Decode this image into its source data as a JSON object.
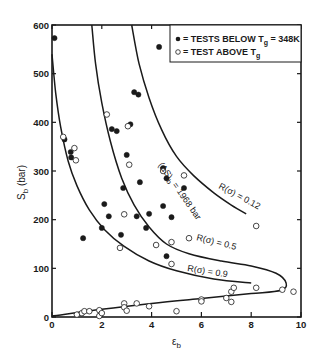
{
  "chart_data": {
    "type": "scatter",
    "title": "",
    "xlabel": "ε_b",
    "ylabel": "S_b (bar)",
    "xlim": [
      0,
      10
    ],
    "ylim": [
      0,
      600
    ],
    "grid": false,
    "x_ticks": [
      0,
      2,
      4,
      6,
      8,
      10
    ],
    "x_tick_labels": [
      "0",
      "2",
      "4",
      "6",
      "8",
      "10"
    ],
    "y_ticks": [
      0,
      100,
      200,
      300,
      400,
      500,
      600
    ],
    "y_tick_labels": [
      "0",
      "100",
      "200",
      "300",
      "400",
      "500",
      "600"
    ],
    "legend": {
      "position": "top-right",
      "entries": [
        {
          "marker": "filled-circle",
          "label": "= TESTS BELOW T",
          "subscript": "g",
          "suffix": " = 348K"
        },
        {
          "marker": "open-circle",
          "label": "= TEST ABOVE T",
          "subscript": "g",
          "suffix": ""
        }
      ]
    },
    "series": [
      {
        "name": "TESTS BELOW Tg = 348K",
        "marker": "filled",
        "points": [
          [
            0.1,
            573
          ],
          [
            0.5,
            365
          ],
          [
            0.75,
            339
          ],
          [
            0.77,
            328
          ],
          [
            1.25,
            162
          ],
          [
            2.0,
            183
          ],
          [
            2.1,
            232
          ],
          [
            2.28,
            207
          ],
          [
            2.4,
            386
          ],
          [
            2.6,
            382
          ],
          [
            2.77,
            169
          ],
          [
            2.86,
            265
          ],
          [
            3.0,
            333
          ],
          [
            3.15,
            396
          ],
          [
            3.3,
            462
          ],
          [
            3.47,
            457
          ],
          [
            3.4,
            207
          ],
          [
            3.53,
            277
          ],
          [
            3.78,
            183
          ],
          [
            3.9,
            212
          ],
          [
            4.3,
            555
          ],
          [
            4.46,
            306
          ],
          [
            4.46,
            228
          ],
          [
            4.6,
            285
          ],
          [
            4.6,
            125
          ],
          [
            4.8,
            205
          ],
          [
            5.3,
            265
          ]
        ]
      },
      {
        "name": "TEST ABOVE Tg",
        "marker": "open",
        "points": [
          [
            0.45,
            370
          ],
          [
            0.9,
            347
          ],
          [
            0.96,
            322
          ],
          [
            2.2,
            416
          ],
          [
            3.05,
            392
          ],
          [
            3.1,
            313
          ],
          [
            2.9,
            211
          ],
          [
            2.73,
            142
          ],
          [
            4.18,
            148
          ],
          [
            4.46,
            300
          ],
          [
            5.3,
            291
          ],
          [
            4.8,
            154
          ],
          [
            5.5,
            162
          ],
          [
            4.8,
            109
          ],
          [
            8.2,
            187
          ],
          [
            1.0,
            5
          ],
          [
            1.2,
            8
          ],
          [
            1.3,
            12
          ],
          [
            1.5,
            12
          ],
          [
            1.9,
            14
          ],
          [
            1.9,
            2
          ],
          [
            2.0,
            8
          ],
          [
            2.9,
            28
          ],
          [
            2.9,
            20
          ],
          [
            3.0,
            13
          ],
          [
            3.4,
            28
          ],
          [
            3.9,
            22
          ],
          [
            5.0,
            12
          ],
          [
            6.0,
            36
          ],
          [
            6.0,
            32
          ],
          [
            7.0,
            39
          ],
          [
            7.2,
            52
          ],
          [
            7.2,
            31
          ],
          [
            7.3,
            60
          ],
          [
            8.2,
            60
          ],
          [
            9.25,
            56
          ],
          [
            9.7,
            52
          ]
        ]
      }
    ],
    "curves": [
      {
        "name": "(ΔS)b = 1968 bar",
        "label_main": "(ΔS)",
        "label_sub": "b",
        "label_suffix": " = 1968 bar",
        "points": [
          [
            3.2,
            600
          ],
          [
            3.5,
            520
          ],
          [
            3.9,
            450
          ],
          [
            4.4,
            385
          ],
          [
            5.0,
            330
          ],
          [
            5.7,
            290
          ],
          [
            6.5,
            255
          ],
          [
            7.2,
            230
          ],
          [
            7.8,
            212
          ]
        ]
      },
      {
        "name": "R(σ) = 0.12",
        "label": "R(σ) = 0.12"
      },
      {
        "name": "R(σ) = 0.5",
        "label": "R(σ) = 0.5",
        "points": [
          [
            1.6,
            600
          ],
          [
            1.75,
            520
          ],
          [
            2.0,
            440
          ],
          [
            2.35,
            360
          ],
          [
            2.8,
            285
          ],
          [
            3.3,
            230
          ],
          [
            3.9,
            185
          ],
          [
            4.6,
            150
          ],
          [
            5.5,
            130
          ],
          [
            6.8,
            115
          ],
          [
            8.0,
            105
          ],
          [
            9.0,
            90
          ],
          [
            9.4,
            70
          ],
          [
            9.2,
            55
          ],
          [
            8.0,
            48
          ],
          [
            6.0,
            38
          ],
          [
            4.0,
            28
          ],
          [
            2.0,
            16
          ],
          [
            0.0,
            2
          ]
        ]
      },
      {
        "name": "R(σ) = 0.9",
        "label": "R(σ) = 0.9",
        "points": [
          [
            0.0,
            540
          ],
          [
            0.15,
            460
          ],
          [
            0.35,
            390
          ],
          [
            0.65,
            320
          ],
          [
            1.0,
            270
          ],
          [
            1.5,
            220
          ],
          [
            2.1,
            180
          ],
          [
            2.9,
            145
          ],
          [
            3.9,
            115
          ],
          [
            5.0,
            95
          ],
          [
            6.5,
            78
          ],
          [
            8.0,
            70
          ]
        ]
      }
    ],
    "annotations": [
      {
        "text": "(ΔS)b = 1968 bar",
        "x": 4.3,
        "y": 305,
        "rotation": 52
      },
      {
        "text": "R(σ) = 0.12",
        "x": 6.5,
        "y": 232,
        "rotation": 30
      },
      {
        "text": "R(σ) = 0.5",
        "x": 6.3,
        "y": 133,
        "rotation": 14
      },
      {
        "text": "R(σ) = 0.9",
        "x": 5.3,
        "y": 80,
        "rotation": 10
      }
    ]
  },
  "axes": {
    "xlabel_main": "ε",
    "xlabel_sub": "b",
    "ylabel_main": "S",
    "ylabel_sub": "b",
    "ylabel_unit": " (bar)"
  },
  "legend": {
    "below": {
      "prefix": "= TESTS BELOW T",
      "sub": "g",
      "suffix": " = 348K"
    },
    "above": {
      "prefix": "= TEST ABOVE T",
      "sub": "g"
    }
  },
  "curve_labels": {
    "delta_s": {
      "main": "(ΔS)",
      "sub": "b",
      "suffix": " = 1968 bar"
    },
    "r012": "R(σ) = 0.12",
    "r05": "R(σ) = 0.5",
    "r09": "R(σ) = 0.9"
  }
}
